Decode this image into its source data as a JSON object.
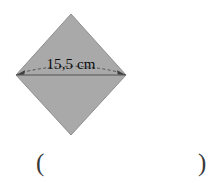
{
  "figure": {
    "type": "rhombus-diagram",
    "shape_name": "rhombus",
    "fill_color": "#a9a9a9",
    "stroke_color": "#8a8a8a",
    "background_color": "#ffffff",
    "dimension": {
      "label": "15,5 cm",
      "value": 15.5,
      "unit": "cm",
      "decimal_separator": ",",
      "measures": "horizontal-diagonal",
      "arrow_style": "double-headed-dashed-arc",
      "arrow_color": "#4a4a4a"
    },
    "vertices": {
      "top": [
        71,
        14
      ],
      "right": [
        126,
        75
      ],
      "bottom": [
        71,
        135
      ],
      "left": [
        16,
        75
      ]
    },
    "diagonal_line": {
      "from": [
        16,
        75
      ],
      "to": [
        126,
        75
      ],
      "color": "#6b6b6b"
    }
  },
  "answer": {
    "open_paren": "(",
    "close_paren": ")",
    "value": ""
  }
}
